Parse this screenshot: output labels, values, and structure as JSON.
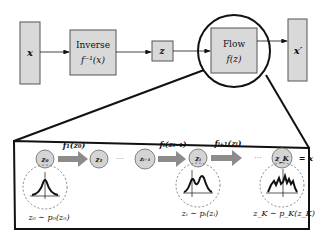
{
  "colors": {
    "box_fill": "#d9d9d9",
    "box_stroke": "#555555",
    "line": "#111111",
    "arrow_fill": "#8c8c8c",
    "node_fill": "#d4d4d4",
    "dashed": "#666666"
  },
  "top_row": {
    "x_box": {
      "label": "x"
    },
    "inverse_box": {
      "title": "Inverse",
      "formula": "f⁻¹(x)"
    },
    "z_box": {
      "label": "z"
    },
    "flow_box": {
      "title": "Flow",
      "formula": "f(z)"
    },
    "x_prime_box": {
      "label": "x′"
    }
  },
  "detail_panel": {
    "nodes": [
      {
        "id": "z0",
        "label": "z₀"
      },
      {
        "id": "z1",
        "label": "z₁"
      },
      {
        "id": "zi-1",
        "label": "zᵢ₋₁"
      },
      {
        "id": "zi",
        "label": "zᵢ"
      },
      {
        "id": "zK",
        "label": "z_K"
      }
    ],
    "transforms": [
      {
        "label": "f₁(z₀)"
      },
      {
        "label": "fᵢ(zᵢ₋₁)"
      },
      {
        "label": "fᵢ₊₁(zᵢ)"
      }
    ],
    "ellipsis": "···",
    "final_eq": "= x",
    "distributions": [
      {
        "label": "z₀ ∼ p₀(z₀)",
        "shape": "unimodal"
      },
      {
        "label": "zᵢ ∼ pᵢ(zᵢ)",
        "shape": "bimodal"
      },
      {
        "label": "z_K ∼ p_K(z_K)",
        "shape": "multimodal"
      }
    ]
  }
}
